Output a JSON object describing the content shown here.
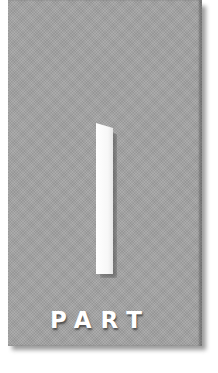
{
  "part_page": {
    "numeral": "I",
    "label": "PART",
    "colors": {
      "panel": "#a4a4a4",
      "numeral": "#ffffff",
      "label": "#ffffff",
      "background": "#ffffff"
    }
  }
}
